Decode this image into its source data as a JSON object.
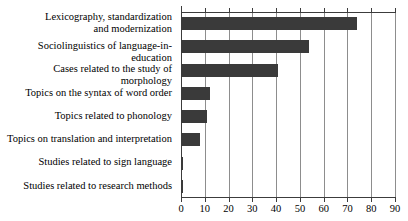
{
  "chart_data": {
    "type": "bar",
    "orientation": "horizontal",
    "title": "",
    "subtitle": "",
    "xlabel": "",
    "ylabel": "",
    "xlim": [
      0,
      90
    ],
    "ylim": null,
    "grid": true,
    "legend": false,
    "legend_position": "none",
    "bar_color": "#3a3a3a",
    "axis_color": "#3c3c3c",
    "grid_color": "#8d8d8d",
    "background_color": "#ffffff",
    "xticks": [
      0,
      10,
      20,
      30,
      40,
      50,
      60,
      70,
      80,
      90
    ],
    "xtick_labels": [
      "0",
      "10",
      "20",
      "30",
      "40",
      "50",
      "60",
      "70",
      "80",
      "90"
    ],
    "categories": [
      "Lexicography, standardization\nand modernization",
      "Sociolinguistics of language-in-education",
      "Cases related to the study of morphology",
      "Topics on the syntax of word order",
      "Topics related to phonology",
      "Topics on translation and interpretation",
      "Studies related to sign language",
      "Studies related to research methods"
    ],
    "values": [
      74,
      54,
      41,
      12,
      11,
      8,
      1,
      1
    ]
  }
}
